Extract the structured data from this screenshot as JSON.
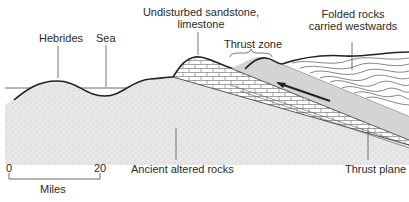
{
  "diagram": {
    "labels": {
      "hebrides": "Hebrides",
      "sea": "Sea",
      "undisturbed_line1": "Undisturbed sandstone,",
      "undisturbed_line2": "limestone",
      "thrust_zone": "Thrust zone",
      "folded_line1": "Folded rocks",
      "folded_line2": "carried westwards",
      "ancient": "Ancient altered rocks",
      "thrust_plane": "Thrust plane"
    },
    "scale": {
      "start": "0",
      "end": "20",
      "unit": "Miles"
    },
    "colors": {
      "stipple_fill": "#e6e6e6",
      "thrust_sheet_fill": "#d4d4d4",
      "line": "#222222",
      "leader": "#555555"
    }
  }
}
